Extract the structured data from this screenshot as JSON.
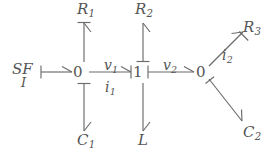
{
  "diagram": {
    "type": "bond-graph",
    "background_color": "#ffffff",
    "stroke_color": "#6b6b6b",
    "text_color": "#555555"
  },
  "source": {
    "name": "SF",
    "subscript": "I",
    "label": "SF",
    "sub_label": "I"
  },
  "junctions": [
    {
      "id": "j0a",
      "label": "0",
      "kind": "zero-junction",
      "x": 78,
      "y": 72
    },
    {
      "id": "j1",
      "label": "1",
      "kind": "one-junction",
      "x": 138,
      "y": 72
    },
    {
      "id": "j0b",
      "label": "0",
      "kind": "zero-junction",
      "x": 201,
      "y": 72
    }
  ],
  "elements": [
    {
      "id": "R1",
      "base": "R",
      "sub": "1",
      "x": 88,
      "y": 10
    },
    {
      "id": "R2",
      "base": "R",
      "sub": "2",
      "x": 146,
      "y": 10
    },
    {
      "id": "R3",
      "base": "R",
      "sub": "3",
      "x": 253,
      "y": 28
    },
    {
      "id": "C1",
      "base": "C",
      "sub": "1",
      "x": 88,
      "y": 141
    },
    {
      "id": "C2",
      "base": "C",
      "sub": "2",
      "x": 253,
      "y": 133
    },
    {
      "id": "L",
      "base": "L",
      "sub": "",
      "x": 142,
      "y": 141
    }
  ],
  "bond_labels": [
    {
      "id": "v1",
      "base": "v",
      "sub": "1",
      "position": "above-bond"
    },
    {
      "id": "i1",
      "base": "i",
      "sub": "1",
      "position": "below-bond"
    },
    {
      "id": "v2",
      "base": "v",
      "sub": "2",
      "position": "above-bond"
    },
    {
      "id": "i2",
      "base": "i",
      "sub": "2",
      "position": "below-bond"
    }
  ],
  "bonds": [
    {
      "from": "SF",
      "to": "j0a",
      "arrow": "half-arrow",
      "causality": "at-source"
    },
    {
      "from": "j0a",
      "to": "R1",
      "arrow": "half-arrow",
      "causality": "at-element"
    },
    {
      "from": "j0a",
      "to": "C1",
      "arrow": "half-arrow",
      "causality": "at-junction"
    },
    {
      "from": "j0a",
      "to": "j1",
      "arrow": "half-arrow",
      "causality": "at-junction-1",
      "labels": [
        "v1",
        "i1"
      ]
    },
    {
      "from": "j1",
      "to": "R2",
      "arrow": "half-arrow",
      "causality": "at-junction"
    },
    {
      "from": "j1",
      "to": "L",
      "arrow": "half-arrow",
      "causality": "none"
    },
    {
      "from": "j1",
      "to": "j0b",
      "arrow": "half-arrow",
      "causality": "at-junction-1",
      "labels": [
        "v2"
      ]
    },
    {
      "from": "j0b",
      "to": "R3",
      "arrow": "half-arrow",
      "causality": "at-element",
      "labels": [
        "i2"
      ]
    },
    {
      "from": "j0b",
      "to": "C2",
      "arrow": "half-arrow",
      "causality": "at-junction"
    }
  ]
}
